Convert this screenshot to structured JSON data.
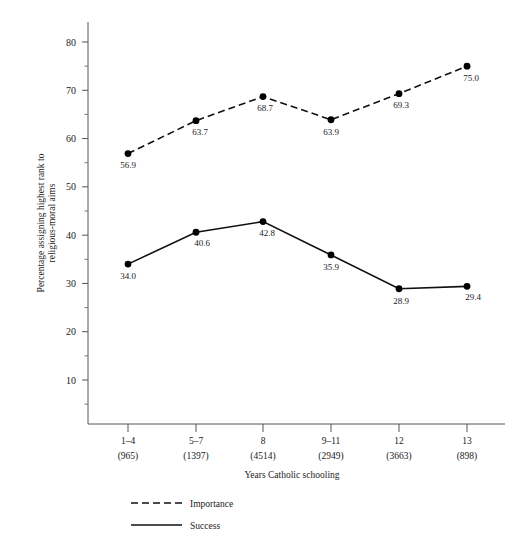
{
  "chart_data": {
    "type": "line",
    "title": "",
    "xlabel": "Years Catholic schooling",
    "ylabel": "Percentage assigning highest rank to religious-moral aims",
    "ylabel_line1": "Percentage assigning highest rank to",
    "ylabel_line2": "religious-moral aims",
    "categories": [
      "1–4",
      "5–7",
      "8",
      "9–11",
      "12",
      "13"
    ],
    "category_counts": [
      "(965)",
      "(1397)",
      "(4514)",
      "(2949)",
      "(3663)",
      "(898)"
    ],
    "series": [
      {
        "name": "Importance",
        "style": "dashed",
        "values": [
          56.9,
          63.7,
          68.7,
          63.9,
          69.3,
          75.0
        ],
        "value_labels": [
          "56.9",
          "63.7",
          "68.7",
          "63.9",
          "69.3",
          "75.0"
        ]
      },
      {
        "name": "Success",
        "style": "solid",
        "values": [
          34.0,
          40.6,
          42.8,
          35.9,
          28.9,
          29.4
        ],
        "value_labels": [
          "34.0",
          "40.6",
          "42.8",
          "35.9",
          "28.9",
          "29.4"
        ]
      }
    ],
    "ylim": [
      0,
      85
    ],
    "yticks": [
      10,
      20,
      30,
      40,
      50,
      60,
      70,
      80
    ],
    "ytick_labels": [
      "10",
      "20",
      "30",
      "40",
      "50",
      "60",
      "70",
      "80"
    ],
    "yminor_ticks": [
      5,
      15,
      25,
      35,
      45,
      55,
      65,
      75
    ],
    "grid": false,
    "legend_position": "below-left",
    "colors": {
      "line": "#111111",
      "marker": "#000000",
      "axis": "#444444",
      "text": "#1a1a1a"
    }
  },
  "legend": {
    "entries": [
      {
        "label": "Importance",
        "style": "dashed"
      },
      {
        "label": "Success",
        "style": "solid"
      }
    ]
  }
}
